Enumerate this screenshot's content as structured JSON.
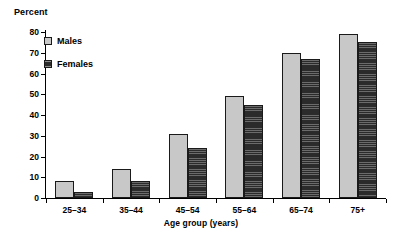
{
  "chart_data": {
    "type": "bar",
    "title": "",
    "ylabel": "Percent",
    "xlabel": "Age group (years)",
    "categories": [
      "25–34",
      "35–44",
      "45–54",
      "55–64",
      "65–74",
      "75+"
    ],
    "series": [
      {
        "name": "Males",
        "color": "#c8c8c8",
        "values": [
          8,
          14,
          31,
          49,
          70,
          79
        ]
      },
      {
        "name": "Females",
        "color": "#2b2b2b",
        "values": [
          3,
          8,
          24,
          45,
          67,
          75
        ]
      }
    ],
    "ylim": [
      0,
      80
    ],
    "ytick_step": 10,
    "yticks": [
      0,
      10,
      20,
      30,
      40,
      50,
      60,
      70,
      80
    ],
    "ytick_labels": [
      "0",
      "10",
      "20",
      "30",
      "40",
      "50",
      "60",
      "70",
      "80"
    ],
    "grid": false,
    "legend_position": "upper-left-inside"
  }
}
